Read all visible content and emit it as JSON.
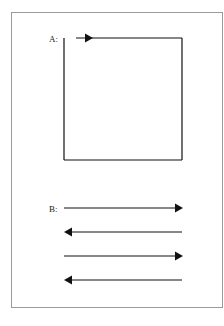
{
  "figure": {
    "panel_a": {
      "label": "A:",
      "description": "Square path with arrow indicating clockwise direction along the top edge"
    },
    "panel_b": {
      "label": "B:",
      "arrows": [
        {
          "direction": "right"
        },
        {
          "direction": "left"
        },
        {
          "direction": "right"
        },
        {
          "direction": "left"
        }
      ]
    }
  }
}
